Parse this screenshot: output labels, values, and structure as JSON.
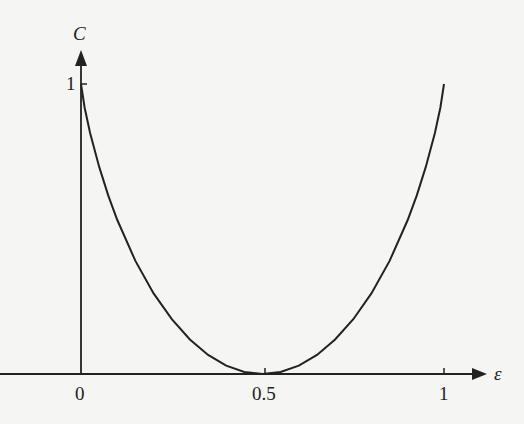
{
  "chart_data": {
    "type": "line",
    "title": "",
    "xlabel": "ε",
    "ylabel": "C",
    "xlim": [
      0,
      1
    ],
    "ylim": [
      0,
      1
    ],
    "grid": false,
    "legend": null,
    "x_ticks": [
      "0",
      "0.5",
      "1"
    ],
    "y_ticks": [
      "1"
    ],
    "series": [
      {
        "name": "C = 1 - H(ε)",
        "x": [
          0,
          0.01,
          0.025,
          0.05,
          0.075,
          0.1,
          0.15,
          0.2,
          0.25,
          0.3,
          0.35,
          0.4,
          0.45,
          0.5,
          0.55,
          0.6,
          0.65,
          0.7,
          0.75,
          0.8,
          0.85,
          0.9,
          0.925,
          0.95,
          0.975,
          0.99,
          1
        ],
        "values": [
          1,
          0.919,
          0.831,
          0.714,
          0.616,
          0.531,
          0.39,
          0.278,
          0.189,
          0.119,
          0.066,
          0.029,
          0.007,
          0,
          0.007,
          0.029,
          0.066,
          0.119,
          0.189,
          0.278,
          0.39,
          0.531,
          0.616,
          0.714,
          0.831,
          0.919,
          1
        ]
      }
    ]
  },
  "labels": {
    "y_axis": "C",
    "x_axis": "ε",
    "x_tick_0": "0",
    "x_tick_05": "0.5",
    "x_tick_1": "1",
    "y_tick_1": "1"
  }
}
